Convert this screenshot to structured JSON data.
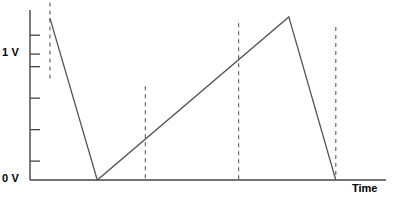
{
  "chart_data": {
    "type": "line",
    "title": "",
    "subtitle": "",
    "xlabel": "Time",
    "ylabel": "",
    "grid": false,
    "legend": "none",
    "xlim": [
      0,
      1
    ],
    "ylim": [
      0,
      1.35
    ],
    "y_tick_labels": [
      "0 V",
      "1 V"
    ],
    "y_ticks_labeled": [
      {
        "label": "0 V",
        "value": 0
      },
      {
        "label": "1 V",
        "value": 1
      }
    ],
    "y_tick_count": 7,
    "y_tick_values": [
      0.15,
      0.4,
      0.65,
      0.9,
      1.0,
      1.15,
      1.3
    ],
    "x_tick_labels": [],
    "series": [
      {
        "name": "voltage",
        "color": "#555555",
        "points": [
          {
            "x": 0.056,
            "y": 1.285
          },
          {
            "x": 0.189,
            "y": 0.0
          },
          {
            "x": 0.727,
            "y": 1.295
          },
          {
            "x": 0.859,
            "y": 0.0
          }
        ],
        "point_labels": [
          "peak-start",
          "trough-1",
          "peak-2",
          "trough-2"
        ]
      }
    ],
    "annotations": {
      "dashed_markers": [
        {
          "name": "marker-1",
          "x": 0.056,
          "y_top": 1.41,
          "y_bottom": 0.78,
          "color": "#666666"
        },
        {
          "name": "marker-2",
          "x": 0.324,
          "y_top": 0.745,
          "y_bottom": 0.0,
          "color": "#666666"
        },
        {
          "name": "marker-3",
          "x": 0.586,
          "y_top": 1.245,
          "y_bottom": 0.0,
          "color": "#666666"
        },
        {
          "name": "marker-4",
          "x": 0.859,
          "y_top": 1.215,
          "y_bottom": 0.0,
          "color": "#666666"
        }
      ]
    },
    "colors": {
      "axis": "#444444",
      "waveform": "#555555",
      "marker": "#666666",
      "text": "#000000",
      "background": "#ffffff"
    }
  },
  "axes": {
    "y_axis_name": "voltage-axis",
    "x_axis_name": "time-axis",
    "x_axis_label": "Time"
  }
}
